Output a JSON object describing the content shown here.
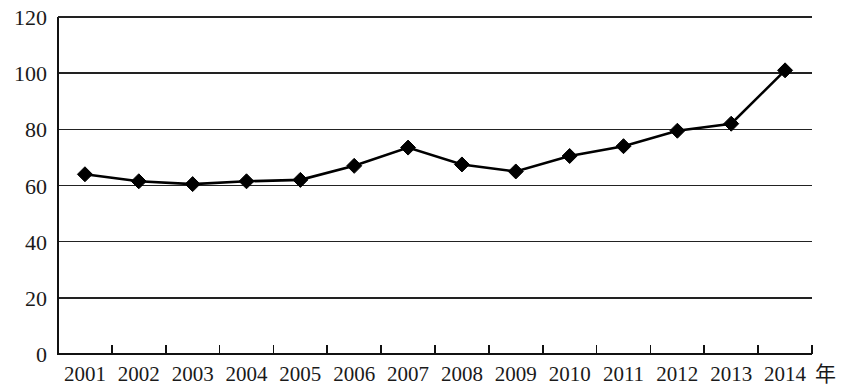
{
  "chart_data": {
    "type": "line",
    "title": "",
    "subtitle": "",
    "xlabel": "年",
    "ylabel": "",
    "categories": [
      "2001",
      "2002",
      "2003",
      "2004",
      "2005",
      "2006",
      "2007",
      "2008",
      "2009",
      "2010",
      "2011",
      "2012",
      "2013",
      "2014"
    ],
    "values": [
      64,
      61.5,
      60.5,
      61.5,
      62,
      67,
      73.5,
      67.5,
      65,
      70.5,
      74,
      79.5,
      82,
      101
    ],
    "series": [
      {
        "name": "",
        "values": [
          64,
          61.5,
          60.5,
          61.5,
          62,
          67,
          73.5,
          67.5,
          65,
          70.5,
          74,
          79.5,
          82,
          101
        ]
      }
    ],
    "ylim": [
      0,
      120
    ],
    "yticks": [
      0,
      20,
      40,
      60,
      80,
      100,
      120
    ],
    "ytick_labels": [
      "0",
      "20",
      "40",
      "60",
      "80",
      "100",
      "120"
    ],
    "xtick_labels": [
      "2001",
      "2002",
      "2003",
      "2004",
      "2005",
      "2006",
      "2007",
      "2008",
      "2009",
      "2010",
      "2011",
      "2012",
      "2013",
      "2014"
    ],
    "grid": true,
    "grid_axis": "y",
    "legend": false,
    "legend_position": "none",
    "marker": "diamond",
    "marker_color": "#000000",
    "line_color": "#000000",
    "background_color": "#ffffff",
    "annotations": []
  },
  "axes": {
    "y_unit": "",
    "x_unit_label": "年"
  }
}
